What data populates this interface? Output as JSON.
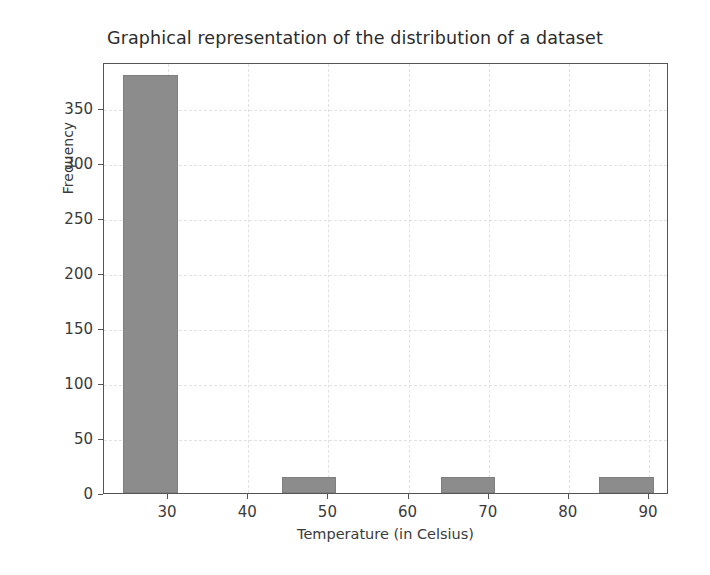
{
  "chart_data": {
    "type": "bar",
    "title": "Graphical representation of the distribution of a dataset",
    "xlabel": "Temperature (in Celsius)",
    "ylabel": "Frequency",
    "xlim": [
      22.0,
      92.5
    ],
    "ylim": [
      0,
      392
    ],
    "grid": true,
    "legend": null,
    "bar_color": "#8c8c8c",
    "bar_edge_color": "#7f7f7f",
    "xticks": [
      30,
      40,
      50,
      60,
      70,
      80,
      90
    ],
    "xtick_labels": [
      "30",
      "40",
      "50",
      "60",
      "70",
      "80",
      "90"
    ],
    "yticks": [
      0,
      50,
      100,
      150,
      200,
      250,
      300,
      350
    ],
    "ytick_labels": [
      "0",
      "50",
      "100",
      "150",
      "200",
      "250",
      "300",
      "350"
    ],
    "bins": [
      {
        "label": "24.4-31.2",
        "x0": 24.4,
        "x1": 31.2,
        "value": 380
      },
      {
        "label": "44.2-51.0",
        "x0": 44.2,
        "x1": 51.0,
        "value": 15
      },
      {
        "label": "64.0-70.8",
        "x0": 64.0,
        "x1": 70.8,
        "value": 15
      },
      {
        "label": "83.8-90.6",
        "x0": 83.8,
        "x1": 90.6,
        "value": 15
      }
    ],
    "categories": [
      "24.4-31.2",
      "44.2-51.0",
      "64.0-70.8",
      "83.8-90.6"
    ],
    "values": [
      380,
      15,
      15,
      15
    ]
  }
}
